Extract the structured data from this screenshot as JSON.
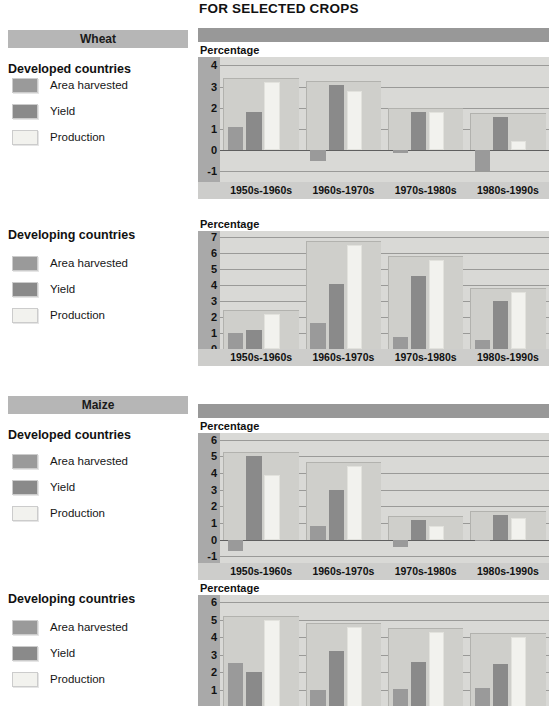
{
  "header": {
    "title": "FOR SELECTED CROPS"
  },
  "colors": {
    "area_harvested": "#9a9a9a",
    "yield": "#8a8a8a",
    "production": "#f2f2ee",
    "crop_band": "#b6b6b6",
    "chart_topbar": "#989898",
    "plot_background": "#d9d9d6",
    "axis_strip": "#a9a9a9",
    "x_axis_band": "#cdcdcb"
  },
  "sections": [
    {
      "crop": "Wheat",
      "country_group": "Developed countries",
      "legend": [
        {
          "label": "Area harvested",
          "swatch": "#9a9a9a"
        },
        {
          "label": "Yield",
          "swatch": "#8a8a8a"
        },
        {
          "label": "Production",
          "swatch": "#f2f2ee"
        }
      ],
      "axis_title": "Percentage"
    },
    {
      "crop": "",
      "country_group": "Developing countries",
      "legend": [
        {
          "label": "Area harvested",
          "swatch": "#9a9a9a"
        },
        {
          "label": "Yield",
          "swatch": "#8a8a8a"
        },
        {
          "label": "Production",
          "swatch": "#f2f2ee"
        }
      ],
      "axis_title": "Percentage"
    },
    {
      "crop": "Maize",
      "country_group": "Developed countries",
      "legend": [
        {
          "label": "Area harvested",
          "swatch": "#9a9a9a"
        },
        {
          "label": "Yield",
          "swatch": "#8a8a8a"
        },
        {
          "label": "Production",
          "swatch": "#f2f2ee"
        }
      ],
      "axis_title": "Percentage"
    },
    {
      "crop": "",
      "country_group": "Developing countries",
      "legend": [
        {
          "label": "Area harvested",
          "swatch": "#9a9a9a"
        },
        {
          "label": "Yield",
          "swatch": "#8a8a8a"
        },
        {
          "label": "Production",
          "swatch": "#f2f2ee"
        }
      ],
      "axis_title": "Percentage"
    }
  ],
  "chart_data": [
    {
      "type": "bar",
      "title": "Wheat - Developed countries",
      "ylabel": "Percentage",
      "xlabel": "",
      "ylim": [
        -1.5,
        4.4
      ],
      "yticks": [
        -1,
        0,
        1,
        2,
        3,
        4
      ],
      "grid": true,
      "legend_position": "left-panel",
      "categories": [
        "1950s-1960s",
        "1960s-1970s",
        "1970s-1980s",
        "1980s-1990s"
      ],
      "series": [
        {
          "name": "Area harvested",
          "values": [
            1.1,
            -0.5,
            -0.15,
            -1.0
          ],
          "color": "#9a9a9a"
        },
        {
          "name": "Yield",
          "values": [
            1.8,
            3.1,
            1.8,
            1.55
          ],
          "color": "#8a8a8a"
        },
        {
          "name": "Production",
          "values": [
            3.2,
            2.8,
            1.8,
            0.45
          ],
          "color": "#f2f2ee"
        }
      ]
    },
    {
      "type": "bar",
      "title": "Wheat - Developing countries",
      "ylabel": "Percentage",
      "xlabel": "",
      "ylim": [
        0,
        7.4
      ],
      "yticks": [
        0,
        1,
        2,
        3,
        4,
        5,
        6,
        7
      ],
      "grid": true,
      "legend_position": "left-panel",
      "categories": [
        "1950s-1960s",
        "1960s-1970s",
        "1970s-1980s",
        "1980s-1990s"
      ],
      "series": [
        {
          "name": "Area harvested",
          "values": [
            1.0,
            1.65,
            0.75,
            0.55
          ],
          "color": "#9a9a9a"
        },
        {
          "name": "Yield",
          "values": [
            1.2,
            4.1,
            4.6,
            3.0
          ],
          "color": "#8a8a8a"
        },
        {
          "name": "Production",
          "values": [
            2.2,
            6.5,
            5.6,
            3.6
          ],
          "color": "#f2f2ee"
        }
      ]
    },
    {
      "type": "bar",
      "title": "Maize - Developed countries",
      "ylabel": "Percentage",
      "xlabel": "",
      "ylim": [
        -1.4,
        6.4
      ],
      "yticks": [
        -1,
        0,
        1,
        2,
        3,
        4,
        5,
        6
      ],
      "grid": true,
      "legend_position": "left-panel",
      "categories": [
        "1950s-1960s",
        "1960s-1970s",
        "1970s-1980s",
        "1980s-1990s"
      ],
      "series": [
        {
          "name": "Area harvested",
          "values": [
            -0.7,
            0.85,
            -0.45,
            -0.1
          ],
          "color": "#9a9a9a"
        },
        {
          "name": "Yield",
          "values": [
            5.0,
            3.0,
            1.2,
            1.5
          ],
          "color": "#8a8a8a"
        },
        {
          "name": "Production",
          "values": [
            3.9,
            4.4,
            0.85,
            1.3
          ],
          "color": "#f2f2ee"
        }
      ]
    },
    {
      "type": "bar",
      "title": "Maize - Developing countries",
      "ylabel": "Percentage",
      "xlabel": "",
      "ylim": [
        0,
        6.4
      ],
      "yticks": [
        1,
        2,
        3,
        4,
        5,
        6
      ],
      "grid": true,
      "legend_position": "left-panel",
      "categories": [
        "1950s-1960s",
        "1960s-1970s",
        "1970s-1980s",
        "1980s-1990s"
      ],
      "series": [
        {
          "name": "Area harvested",
          "values": [
            2.5,
            0.95,
            1.05,
            1.1
          ],
          "color": "#9a9a9a"
        },
        {
          "name": "Yield",
          "values": [
            2.0,
            3.2,
            2.6,
            2.45
          ],
          "color": "#8a8a8a"
        },
        {
          "name": "Production",
          "values": [
            5.0,
            4.6,
            4.3,
            4.0
          ],
          "color": "#f2f2ee"
        }
      ]
    }
  ]
}
